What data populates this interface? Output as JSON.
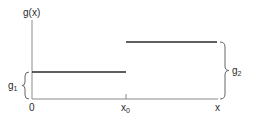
{
  "diagram": {
    "type": "step-function",
    "y_axis_label": "g(x)",
    "x_axis_label": "x",
    "origin_label": "0",
    "breakpoint_label": {
      "base": "x",
      "sub": "0"
    },
    "segments": [
      {
        "name": "lower",
        "from": "0",
        "to": "x0",
        "level_label": {
          "base": "g",
          "sub": "1"
        }
      },
      {
        "name": "upper",
        "from": "x0",
        "to": "x",
        "level_label": {
          "base": "g",
          "sub": "2"
        }
      }
    ],
    "colors": {
      "line": "#2a2a2a",
      "axis": "#8a8a8a",
      "brace": "#666666"
    }
  }
}
